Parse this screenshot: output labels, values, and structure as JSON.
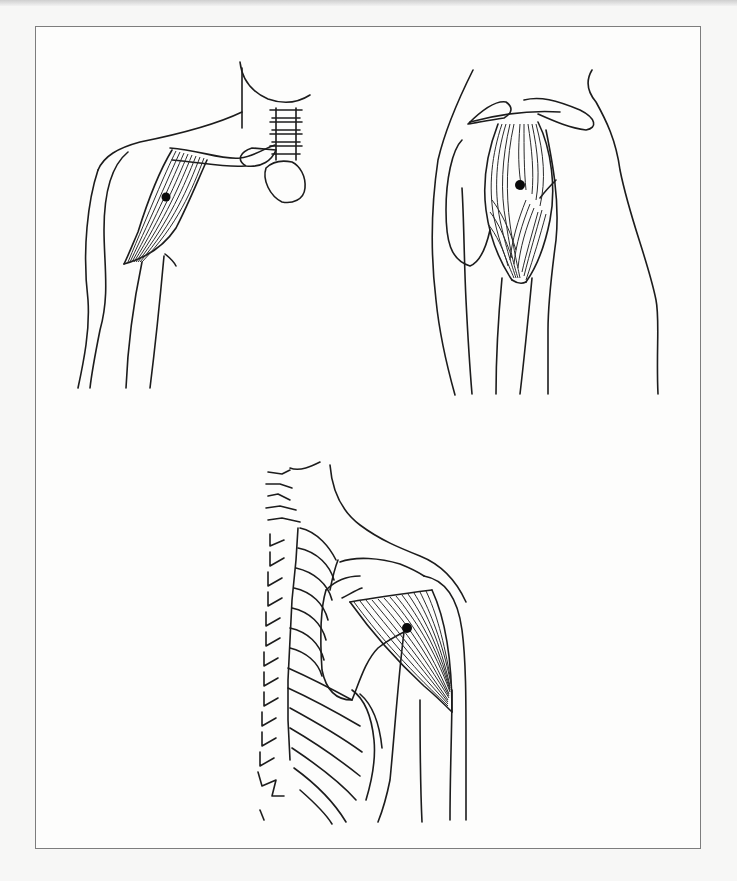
{
  "figure": {
    "type": "anatomical-line-drawing",
    "panels": [
      {
        "id": "anterior",
        "label": "anterior-deltoid-view",
        "trigger_points": 1
      },
      {
        "id": "lateral",
        "label": "lateral-deltoid-view",
        "trigger_points": 1
      },
      {
        "id": "posterior",
        "label": "posterior-deltoid-view",
        "trigger_points": 1
      }
    ],
    "colors": {
      "line": "#1c1c1c",
      "paper": "#fdfdfc",
      "frame": "#7d7d7d",
      "trigger_point": "#0a0a0a"
    }
  }
}
